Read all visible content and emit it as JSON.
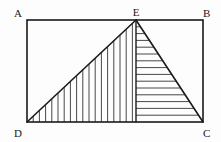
{
  "figure": {
    "background_color": "#fdfdfd",
    "stroke_color": "#1a1a1a",
    "hatch_color": "#333333",
    "labels": {
      "a": "A",
      "b": "B",
      "c": "C",
      "d": "D",
      "e": "E"
    },
    "label_positions": {
      "a": {
        "x": 14,
        "y": 17
      },
      "b": {
        "x": 203,
        "y": 17
      },
      "c": {
        "x": 203,
        "y": 137
      },
      "d": {
        "x": 14,
        "y": 137
      },
      "e": {
        "x": 132,
        "y": 16
      }
    },
    "geometry": {
      "rect": {
        "left": 27,
        "top": 20,
        "right": 203,
        "bottom": 122
      },
      "points": {
        "A": {
          "x": 27,
          "y": 20
        },
        "B": {
          "x": 203,
          "y": 20
        },
        "C": {
          "x": 203,
          "y": 122
        },
        "D": {
          "x": 27,
          "y": 122
        },
        "E": {
          "x": 136,
          "y": 20
        },
        "F": {
          "x": 136,
          "y": 122
        }
      },
      "left_triangle": {
        "name": "triangle-D-E-F",
        "vertices": "D,E,F",
        "hatch": "vertical",
        "hatch_spacing": 6.2,
        "hatch_count": 17
      },
      "right_triangle": {
        "name": "triangle-E-F-C",
        "vertices": "E,F,C",
        "hatch": "horizontal",
        "hatch_spacing": 6.8,
        "hatch_count": 14
      }
    },
    "line_widths": {
      "outline": 1.6,
      "hypotenuse": 1.6,
      "median": 1.4,
      "hatch": 0.9
    }
  }
}
